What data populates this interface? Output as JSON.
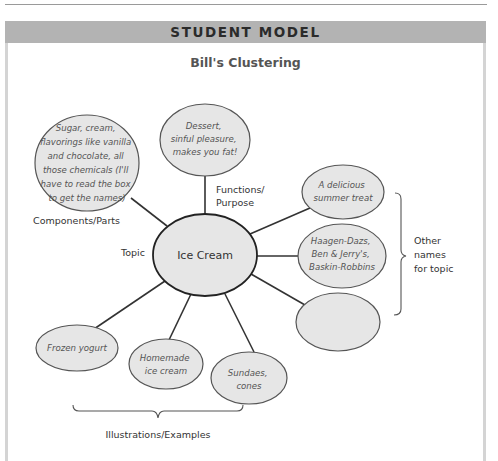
{
  "header": {
    "title": "STUDENT MODEL",
    "subtitle": "Bill's Clustering"
  },
  "colors": {
    "header_bg": "#b3b3b3",
    "node_fill": "#e6e6e6",
    "node_stroke": "#555555",
    "line": "#333333"
  },
  "center": {
    "label": "Ice Cream"
  },
  "nodes": {
    "components": [
      "Sugar, cream,",
      "flavorings like vanilla",
      "and chocolate, all",
      "those chemicals (I'll",
      "have to read the box",
      "to get the names)"
    ],
    "functions": [
      "Dessert,",
      "sinful pleasure,",
      "makes you fat!"
    ],
    "summer": [
      "A delicious",
      "summer treat"
    ],
    "brands": [
      "Haagen-Dazs,",
      "Ben & Jerry's,",
      "Baskin-Robbins"
    ],
    "empty": [],
    "frozen": [
      "Frozen yogurt"
    ],
    "homemade": [
      "Homemade",
      "ice cream"
    ],
    "sundaes": [
      "Sundaes,",
      "cones"
    ]
  },
  "labels": {
    "components": "Components/Parts",
    "functions": [
      "Functions/",
      "Purpose"
    ],
    "topic": "Topic",
    "other_names": [
      "Other",
      "names",
      "for topic"
    ],
    "examples": "Illustrations/Examples"
  }
}
